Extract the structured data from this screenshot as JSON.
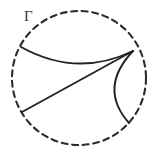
{
  "figure": {
    "caption_label": "Γ",
    "label_position": {
      "x": 24,
      "y": 9
    },
    "background_color": "#ffffff",
    "stroke_color": "#222222",
    "boundary_color": "#2b2b2b",
    "label_color": "#3a3a3a"
  },
  "chart_data": {
    "type": "diagram",
    "title": "",
    "subtitle": "",
    "xlabel": "",
    "ylabel": "",
    "canvas": {
      "width": 159,
      "height": 159
    },
    "annotations": [
      {
        "text": "Γ",
        "x": 24,
        "y": 9,
        "role": "boundary-label"
      }
    ],
    "legend": [],
    "series": [
      {
        "name": "boundary-circle",
        "shape": "circle",
        "style": "dashed",
        "center": {
          "x": 79,
          "y": 78
        },
        "radius": 67,
        "path": "M 146,78 A 67,67 0 1,1 12,78 A 67,67 0 1,1 146,78"
      },
      {
        "name": "upper-geodesic",
        "shape": "arc",
        "style": "solid",
        "start": {
          "x": 21,
          "y": 47
        },
        "end": {
          "x": 133,
          "y": 51
        },
        "control": {
          "x": 77,
          "y": 78
        },
        "path": "M 21,47 Q 77,78 133,51"
      },
      {
        "name": "lower-chord",
        "shape": "line",
        "style": "solid",
        "start": {
          "x": 22,
          "y": 112
        },
        "end": {
          "x": 133,
          "y": 51
        },
        "path": "M 22,112 L 133,51"
      },
      {
        "name": "right-arc",
        "shape": "arc",
        "style": "solid",
        "start": {
          "x": 133,
          "y": 51
        },
        "end": {
          "x": 129,
          "y": 123
        },
        "control": {
          "x": 98,
          "y": 88
        },
        "path": "M 133,51 Q 98,88 129,123"
      }
    ]
  }
}
